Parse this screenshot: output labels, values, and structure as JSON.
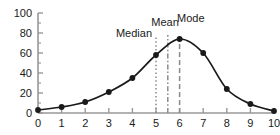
{
  "chart_data": {
    "type": "line",
    "title": "",
    "xlabel": "",
    "ylabel": "",
    "x": [
      0,
      1,
      2,
      3,
      4,
      5,
      6,
      7,
      8,
      9,
      10
    ],
    "values": [
      3,
      6,
      11,
      21,
      35,
      58,
      74,
      60,
      24,
      9,
      2
    ],
    "series": [
      {
        "name": "distribution",
        "values": [
          3,
          6,
          11,
          21,
          35,
          58,
          74,
          60,
          24,
          9,
          2
        ]
      }
    ],
    "xlim": [
      0,
      10
    ],
    "ylim": [
      0,
      100
    ],
    "xticks": [
      "0",
      "1",
      "2",
      "3",
      "4",
      "5",
      "6",
      "7",
      "8",
      "9",
      "10"
    ],
    "yticks": [
      "0",
      "20",
      "40",
      "60",
      "80",
      "100"
    ],
    "y_minor_ticks": [
      10,
      30,
      50,
      70,
      90
    ],
    "grid": false,
    "legend": "none",
    "marker": "filled-circle",
    "line_color": "#1a1a1a",
    "marker_color": "#1a1a1a",
    "axis_color": "#999999",
    "annotations": [
      {
        "label": "Median",
        "x_value": 5,
        "y_top": 100,
        "line_style": "dotted",
        "label_anchor": "end",
        "label_x_px": 152,
        "label_y_px": 37
      },
      {
        "label": "Mean",
        "x_value": 5.5,
        "y_top": 100,
        "line_style": "dash-dot",
        "label_anchor": "middle",
        "label_x_px": 165,
        "label_y_px": 26
      },
      {
        "label": "Mode",
        "x_value": 6,
        "y_top": 100,
        "line_style": "dashed",
        "label_anchor": "start",
        "label_x_px": 177,
        "label_y_px": 22
      }
    ]
  },
  "axes": {
    "y_tick_labels": [
      "100",
      "80",
      "60",
      "40",
      "20",
      "0"
    ],
    "x_tick_labels": [
      "0",
      "1",
      "2",
      "3",
      "4",
      "5",
      "6",
      "7",
      "8",
      "9",
      "10"
    ]
  },
  "colors": {
    "background": "#ffffff",
    "curve": "#1a1a1a",
    "axis": "#999999",
    "annotation_line": "#8a8a8a",
    "text": "#1a1a1a"
  }
}
